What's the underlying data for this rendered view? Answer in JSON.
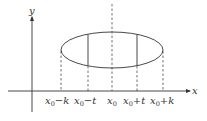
{
  "diagram": {
    "axes": {
      "x_label": "x",
      "y_label": "y"
    },
    "ellipse": {
      "center": [
        112,
        50
      ],
      "rx": 51,
      "ry": 18
    },
    "tick_labels": [
      {
        "base": "x",
        "sub": "0",
        "suffix": "−k",
        "x": 62
      },
      {
        "base": "x",
        "sub": "0",
        "suffix": "−t",
        "x": 88
      },
      {
        "base": "x",
        "sub": "0",
        "suffix": "",
        "x": 112
      },
      {
        "base": "x",
        "sub": "0",
        "suffix": "+t",
        "x": 137
      },
      {
        "base": "x",
        "sub": "0",
        "suffix": "+k",
        "x": 163
      }
    ],
    "dashed_lines_x": [
      62,
      88,
      112,
      137,
      163
    ],
    "solid_chords_x": [
      88,
      137
    ],
    "colors": {
      "stroke": "#333333",
      "background": "#ffffff"
    }
  }
}
